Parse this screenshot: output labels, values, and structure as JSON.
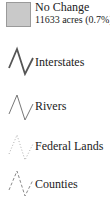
{
  "legend": {
    "swatch_item": {
      "label": "No Change",
      "detail": "11633 acres (0.7%)",
      "fill_color": "#c9c9c9",
      "border_color": "#9a9a9a",
      "icon": "gray-square-swatch"
    },
    "line_items": [
      {
        "label": "Interstates",
        "icon": "solid-thick-zigzag-line",
        "color": "#555555",
        "style": "solid-thick"
      },
      {
        "label": "Rivers",
        "icon": "solid-thin-zigzag-line",
        "color": "#777777",
        "style": "solid-thin"
      },
      {
        "label": "Federal Lands",
        "icon": "dotted-zigzag-line",
        "color": "#b0b0b0",
        "style": "dotted"
      },
      {
        "label": "Counties",
        "icon": "dashed-zigzag-line",
        "color": "#8a8a8a",
        "style": "dashed"
      }
    ]
  }
}
